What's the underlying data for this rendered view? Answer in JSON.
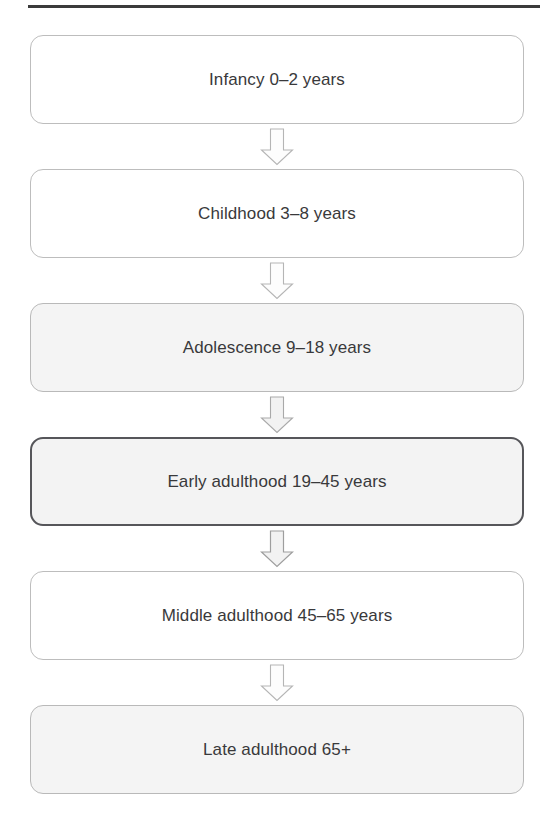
{
  "figure": {
    "name": "human-lifespan-developmental-stages-flowchart",
    "orientation": "vertical",
    "top_rule": {
      "present": true,
      "color": "#3b3b3b"
    },
    "colors": {
      "text": "#39393b",
      "box_border_default": "#bdbdbd",
      "box_border_highlight": "#56565a",
      "box_fill_default": "#ffffff",
      "box_fill_shaded": "#f4f4f4",
      "arrow_stroke": "#b5b5b5",
      "rule": "#3b3b3b"
    },
    "connector_icon": "down-block-arrow-icon",
    "stages": [
      {
        "id": "infancy",
        "label": "Infancy 0–2 years",
        "stage_name": "Infancy",
        "age_range": "0–2 years",
        "style": "default",
        "highlighted": false
      },
      {
        "id": "childhood",
        "label": "Childhood 3–8 years",
        "stage_name": "Childhood",
        "age_range": "3–8 years",
        "style": "default",
        "highlighted": false
      },
      {
        "id": "adolescence",
        "label": "Adolescence 9–18 years",
        "stage_name": "Adolescence",
        "age_range": "9–18 years",
        "style": "shaded",
        "highlighted": false
      },
      {
        "id": "early-adulthood",
        "label": "Early adulthood 19–45 years",
        "stage_name": "Early adulthood",
        "age_range": "19–45 years",
        "style": "highlight",
        "highlighted": true
      },
      {
        "id": "middle-adulthood",
        "label": "Middle adulthood 45–65 years",
        "stage_name": "Middle adulthood",
        "age_range": "45–65 years",
        "style": "default",
        "highlighted": false
      },
      {
        "id": "late-adulthood",
        "label": "Late adulthood 65+",
        "stage_name": "Late adulthood",
        "age_range": "65+",
        "style": "shaded",
        "highlighted": false
      }
    ]
  }
}
